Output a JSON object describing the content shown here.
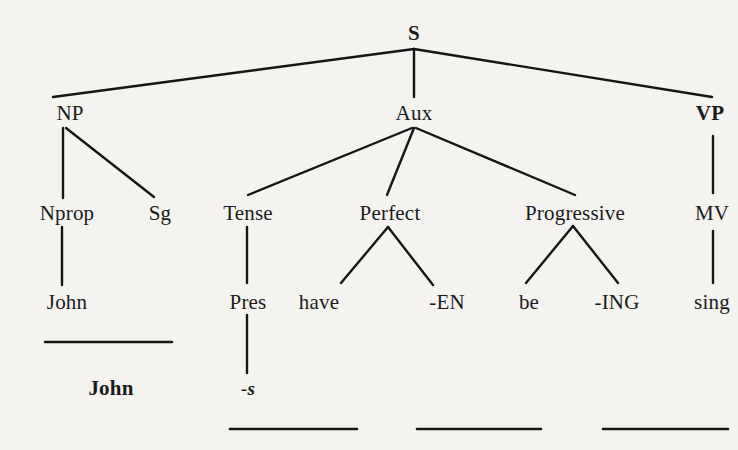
{
  "diagram": {
    "type": "phrase-structure-tree",
    "colors": {
      "background": "#f4f3f0",
      "ink": "#151515"
    },
    "nodes": [
      {
        "id": "S",
        "label": "S",
        "x": 414,
        "y": 33,
        "style": "bold"
      },
      {
        "id": "NP",
        "label": "NP",
        "x": 70,
        "y": 113,
        "style": "normal"
      },
      {
        "id": "Aux",
        "label": "Aux",
        "x": 414,
        "y": 113,
        "style": "normal"
      },
      {
        "id": "VP",
        "label": "VP",
        "x": 710,
        "y": 113,
        "style": "bold"
      },
      {
        "id": "Nprop",
        "label": "Nprop",
        "x": 67,
        "y": 213,
        "style": "normal"
      },
      {
        "id": "Sg",
        "label": "Sg",
        "x": 160,
        "y": 213,
        "style": "normal"
      },
      {
        "id": "Tense",
        "label": "Tense",
        "x": 248,
        "y": 213,
        "style": "normal"
      },
      {
        "id": "Perfect",
        "label": "Perfect",
        "x": 390,
        "y": 213,
        "style": "normal"
      },
      {
        "id": "Progressive",
        "label": "Progressive",
        "x": 575,
        "y": 213,
        "style": "normal"
      },
      {
        "id": "MV",
        "label": "MV",
        "x": 712,
        "y": 213,
        "style": "normal"
      },
      {
        "id": "John1",
        "label": "John",
        "x": 67,
        "y": 302,
        "style": "normal"
      },
      {
        "id": "Pres",
        "label": "Pres",
        "x": 248,
        "y": 302,
        "style": "normal"
      },
      {
        "id": "have",
        "label": "have",
        "x": 319,
        "y": 302,
        "style": "normal"
      },
      {
        "id": "EN",
        "label": "-EN",
        "x": 447,
        "y": 302,
        "style": "normal"
      },
      {
        "id": "be",
        "label": "be",
        "x": 529,
        "y": 302,
        "style": "normal"
      },
      {
        "id": "ING",
        "label": "-ING",
        "x": 617,
        "y": 302,
        "style": "normal"
      },
      {
        "id": "sing",
        "label": "sing",
        "x": 712,
        "y": 302,
        "style": "normal"
      },
      {
        "id": "John2",
        "label": "John",
        "x": 111,
        "y": 388,
        "style": "bold"
      },
      {
        "id": "s",
        "label": "-s",
        "x": 248,
        "y": 388,
        "style": "italic"
      }
    ],
    "edges": [
      {
        "from": "S",
        "to": "NP",
        "x1": 414,
        "y1": 49,
        "x2": 53,
        "y2": 97
      },
      {
        "from": "S",
        "to": "Aux",
        "x1": 414,
        "y1": 49,
        "x2": 414,
        "y2": 97
      },
      {
        "from": "S",
        "to": "VP",
        "x1": 414,
        "y1": 49,
        "x2": 712,
        "y2": 97
      },
      {
        "from": "NP",
        "to": "Nprop",
        "x1": 63,
        "y1": 128,
        "x2": 63,
        "y2": 198
      },
      {
        "from": "NP",
        "to": "Sg",
        "x1": 66,
        "y1": 128,
        "x2": 154,
        "y2": 197
      },
      {
        "from": "Aux",
        "to": "Tense",
        "x1": 412,
        "y1": 128,
        "x2": 248,
        "y2": 195
      },
      {
        "from": "Aux",
        "to": "Perfect",
        "x1": 414,
        "y1": 128,
        "x2": 387,
        "y2": 195
      },
      {
        "from": "Aux",
        "to": "Progressive",
        "x1": 416,
        "y1": 128,
        "x2": 575,
        "y2": 195
      },
      {
        "from": "VP",
        "to": "MV",
        "x1": 713,
        "y1": 136,
        "x2": 713,
        "y2": 193
      },
      {
        "from": "Nprop",
        "to": "John1",
        "x1": 62,
        "y1": 227,
        "x2": 62,
        "y2": 285
      },
      {
        "from": "Tense",
        "to": "Pres",
        "x1": 247,
        "y1": 227,
        "x2": 247,
        "y2": 283
      },
      {
        "from": "Perfect",
        "to": "have",
        "x1": 388,
        "y1": 227,
        "x2": 341,
        "y2": 283
      },
      {
        "from": "Perfect",
        "to": "EN",
        "x1": 388,
        "y1": 227,
        "x2": 433,
        "y2": 285
      },
      {
        "from": "Progressive",
        "to": "be",
        "x1": 573,
        "y1": 226,
        "x2": 526,
        "y2": 283
      },
      {
        "from": "Progressive",
        "to": "ING",
        "x1": 573,
        "y1": 226,
        "x2": 618,
        "y2": 283
      },
      {
        "from": "MV",
        "to": "sing",
        "x1": 713,
        "y1": 231,
        "x2": 713,
        "y2": 283
      },
      {
        "from": "Pres",
        "to": "s",
        "x1": 247,
        "y1": 315,
        "x2": 247,
        "y2": 373
      }
    ],
    "underlines": [
      {
        "id": "underline-john",
        "x1": 45,
        "x2": 172,
        "y": 342
      },
      {
        "id": "underline-tense-slot",
        "x1": 230,
        "x2": 357,
        "y": 429
      },
      {
        "id": "underline-perfect-slot",
        "x1": 417,
        "x2": 541,
        "y": 429
      },
      {
        "id": "underline-progressive-slot",
        "x1": 603,
        "x2": 728,
        "y": 429
      }
    ]
  }
}
